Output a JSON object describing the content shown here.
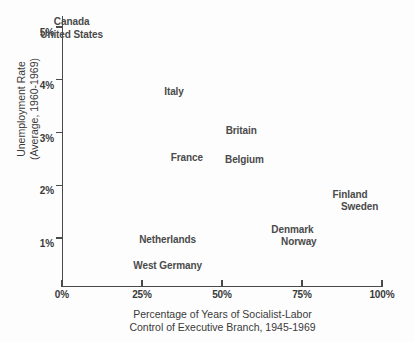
{
  "chart_data": {
    "type": "scatter",
    "title": "",
    "xlabel": "Percentage of Years of Socialist-Labor Control of Executive Branch, 1945-1969",
    "xlabel_lines": [
      "Percentage of Years of Socialist-Labor",
      "Control of Executive Branch, 1945-1969"
    ],
    "ylabel": "Unemployment Rate (Average, 1960-1969)",
    "ylabel_lines": [
      "Unemployment Rate",
      "(Average, 1960-1969)"
    ],
    "xlim": [
      0,
      100
    ],
    "ylim": [
      0,
      5.3
    ],
    "grid": false,
    "legend": "none",
    "marker_style": "text-label-only",
    "xticks": [
      {
        "value": 0,
        "label": "0%"
      },
      {
        "value": 25,
        "label": "25%"
      },
      {
        "value": 50,
        "label": "50%"
      },
      {
        "value": 75,
        "label": "75%"
      },
      {
        "value": 100,
        "label": "100%"
      }
    ],
    "yticks": [
      {
        "value": 1,
        "label": "1%"
      },
      {
        "value": 2,
        "label": "2%"
      },
      {
        "value": 3,
        "label": "3%"
      },
      {
        "value": 4,
        "label": "4%"
      },
      {
        "value": 5,
        "label": "5%"
      }
    ],
    "points": [
      {
        "label": "Canada",
        "x": 3,
        "y": 5.12
      },
      {
        "label": "United States",
        "x": 3,
        "y": 4.87
      },
      {
        "label": "Italy",
        "x": 35,
        "y": 3.78
      },
      {
        "label": "Britain",
        "x": 56,
        "y": 3.05
      },
      {
        "label": "France",
        "x": 39,
        "y": 2.53
      },
      {
        "label": "Belgium",
        "x": 57,
        "y": 2.5
      },
      {
        "label": "Finland",
        "x": 90,
        "y": 1.84
      },
      {
        "label": "Sweden",
        "x": 93,
        "y": 1.61
      },
      {
        "label": "Netherlands",
        "x": 33,
        "y": 0.98
      },
      {
        "label": "Denmark",
        "x": 72,
        "y": 1.17
      },
      {
        "label": "Norway",
        "x": 74,
        "y": 0.94
      },
      {
        "label": "West Germany",
        "x": 33,
        "y": 0.49
      }
    ],
    "colors": {
      "background": "#fdfdfd",
      "axis": "#4a4a4a",
      "text": "#3a3a3a",
      "point_text": "#4a4a4a"
    }
  }
}
